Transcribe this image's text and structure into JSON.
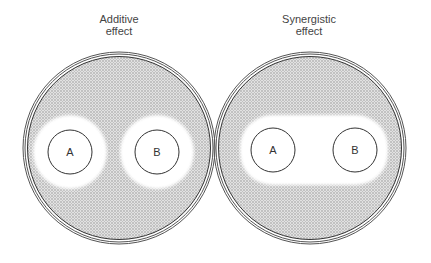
{
  "figure": {
    "panels": [
      {
        "title_line1": "Additive",
        "title_line2": "effect",
        "disks": [
          {
            "label": "A"
          },
          {
            "label": "B"
          }
        ]
      },
      {
        "title_line1": "Synergistic",
        "title_line2": "effect",
        "disks": [
          {
            "label": "A"
          },
          {
            "label": "B"
          }
        ]
      }
    ],
    "colors": {
      "lawn": "#c8c8c8",
      "clear_zone": "#ffffff",
      "outline": "#333333"
    }
  }
}
